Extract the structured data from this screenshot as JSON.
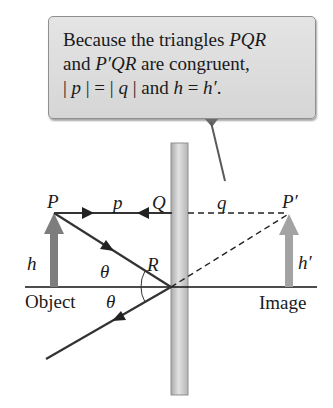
{
  "callout": {
    "line1_prefix": "Because the triangles ",
    "line1_italic": "PQR",
    "line2_prefix": "and ",
    "line2_italic": "P′QR",
    "line2_suffix": " are congruent,",
    "line3_a": "| ",
    "line3_p": "p",
    "line3_b": " | = | ",
    "line3_q": "q",
    "line3_c": " | and ",
    "line3_h": "h",
    "line3_d": " = ",
    "line3_hp": "h′",
    "line3_e": "."
  },
  "labels": {
    "P": "P",
    "p": "p",
    "Q": "Q",
    "q": "q",
    "P_prime": "P′",
    "h": "h",
    "h_prime": "h′",
    "R": "R",
    "theta_incident": "θ",
    "theta_reflected": "θ",
    "object": "Object",
    "image": "Image"
  },
  "colors": {
    "callout_fill": "#d9d9d9",
    "mirror_fill": "#c8c8c8",
    "arrow_gray": "#8a8a8a",
    "ray": "#333333"
  }
}
